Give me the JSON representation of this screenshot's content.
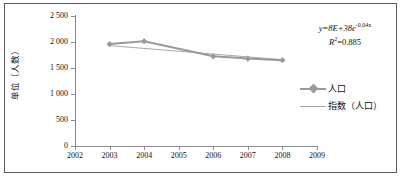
{
  "chart_data": {
    "type": "line",
    "title": "",
    "xlabel": "",
    "ylabel": "单位（人数）",
    "xlim": [
      2002,
      2009
    ],
    "ylim": [
      0,
      2500
    ],
    "grid": false,
    "legend_position": "right",
    "x_ticks": [
      "2002",
      "2003",
      "2004",
      "2005",
      "2006",
      "2007",
      "2008",
      "2009"
    ],
    "y_ticks": [
      "0",
      "500",
      "1 000",
      "1 500",
      "2 000",
      "2 500"
    ],
    "y_tick_values": [
      0,
      500,
      1000,
      1500,
      2000,
      2500
    ],
    "series": [
      {
        "name": "人口",
        "kind": "line-marker",
        "color": "#9a9a9a",
        "marker": "diamond",
        "x": [
          2003,
          2004,
          2006,
          2007,
          2008
        ],
        "values": [
          1960,
          2015,
          1725,
          1680,
          1650
        ]
      },
      {
        "name": "指数（人口）",
        "kind": "trendline",
        "color": "#a8a8a8",
        "x": [
          2003,
          2008
        ],
        "values": [
          1930,
          1660
        ]
      }
    ],
    "annotations": [
      {
        "name": "trendline-equation",
        "equation_prefix": "y=8E+38e",
        "equation_exponent": "-0.04x",
        "r_squared_label": "R",
        "r_squared_sup": "2",
        "r_squared_value": "=0.885"
      }
    ]
  },
  "legend": {
    "items": [
      {
        "label": "人口"
      },
      {
        "label": "指数（人口）"
      }
    ]
  },
  "colors": {
    "series_gray": "#9a9a9a",
    "trendline_gray": "#a8a8a8",
    "axis_gray": "#8a8a8a",
    "frame": "#5a5a5a",
    "text": "#111111",
    "background": "#ffffff"
  }
}
